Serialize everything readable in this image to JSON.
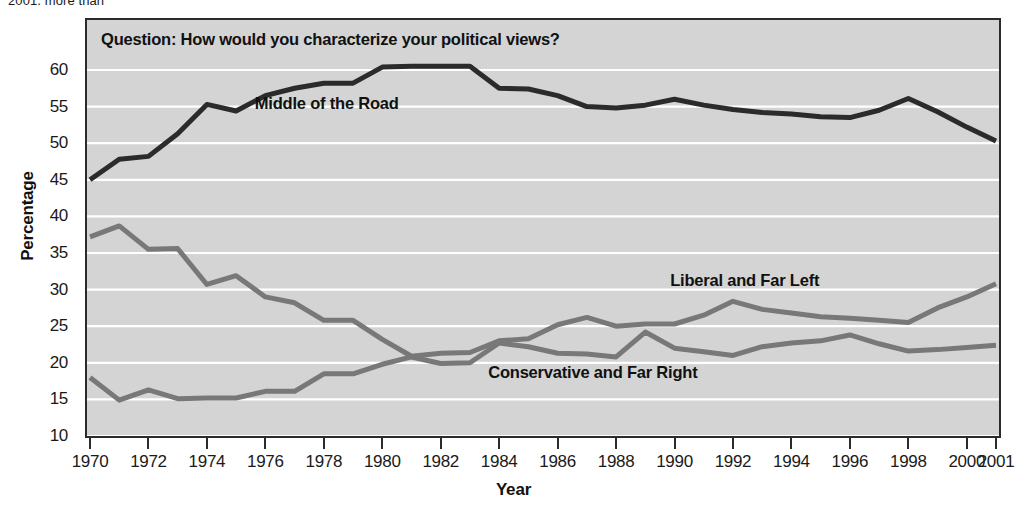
{
  "caption_fragment": "2001, more than",
  "chart_data": {
    "type": "line",
    "title": "Question: How would you characterize your political views?",
    "xlabel": "Year",
    "ylabel": "Percentage",
    "ylim": [
      10,
      60
    ],
    "xlim": [
      1970,
      2001
    ],
    "grid": true,
    "legend_position": "inline-annotations",
    "ytick_labels": [
      "60",
      "55",
      "50",
      "45",
      "40",
      "35",
      "30",
      "25",
      "20",
      "15",
      "10"
    ],
    "ytick_values": [
      60,
      55,
      50,
      45,
      40,
      35,
      30,
      25,
      20,
      15,
      10
    ],
    "xtick_labels": [
      "1970",
      "1972",
      "1974",
      "1976",
      "1978",
      "1980",
      "1982",
      "1984",
      "1986",
      "1988",
      "1990",
      "1992",
      "1994",
      "1996",
      "1998",
      "2000",
      "2001"
    ],
    "xtick_values": [
      1970,
      1972,
      1974,
      1976,
      1978,
      1980,
      1982,
      1984,
      1986,
      1988,
      1990,
      1992,
      1994,
      1996,
      1998,
      2000,
      2001
    ],
    "x": [
      1970,
      1971,
      1972,
      1973,
      1974,
      1975,
      1976,
      1977,
      1978,
      1979,
      1980,
      1981,
      1982,
      1983,
      1984,
      1985,
      1986,
      1987,
      1988,
      1989,
      1990,
      1991,
      1992,
      1993,
      1994,
      1995,
      1996,
      1997,
      1998,
      1999,
      2000,
      2001
    ],
    "series": [
      {
        "name": "Middle of the Road",
        "color": "#2b2b2b",
        "width": 5,
        "label_x": 1978.1,
        "label_y": 55.4,
        "values": [
          45.0,
          47.8,
          48.2,
          51.3,
          55.3,
          54.4,
          56.5,
          57.5,
          58.2,
          58.2,
          60.4,
          60.5,
          60.5,
          60.5,
          57.5,
          57.4,
          56.5,
          55.0,
          54.8,
          55.2,
          56.0,
          55.2,
          54.6,
          54.2,
          54.0,
          53.6,
          53.5,
          54.5,
          56.1,
          54.3,
          52.2,
          50.3
        ]
      },
      {
        "name": "Liberal and Far Left",
        "color": "#787878",
        "width": 5,
        "label_x": 1992.4,
        "label_y": 31.2,
        "values": [
          37.2,
          38.7,
          35.5,
          35.6,
          30.7,
          31.9,
          29.0,
          28.2,
          25.8,
          25.8,
          23.2,
          20.9,
          21.3,
          21.4,
          23.0,
          23.3,
          25.2,
          26.2,
          25.0,
          25.3,
          25.3,
          26.5,
          28.4,
          27.3,
          26.8,
          26.3,
          26.1,
          25.8,
          25.5,
          27.5,
          29.0,
          30.8
        ]
      },
      {
        "name": "Conservative and Far Right",
        "color": "#787878",
        "width": 5,
        "label_x": 1987.2,
        "label_y": 18.6,
        "values": [
          18.0,
          14.9,
          16.3,
          15.1,
          15.2,
          15.2,
          16.1,
          16.1,
          18.5,
          18.5,
          19.8,
          20.8,
          19.9,
          20.0,
          22.7,
          22.2,
          21.3,
          21.2,
          20.8,
          24.2,
          22.0,
          21.5,
          21.0,
          22.2,
          22.7,
          23.0,
          23.8,
          22.6,
          21.6,
          21.8,
          22.1,
          22.4
        ]
      }
    ]
  }
}
